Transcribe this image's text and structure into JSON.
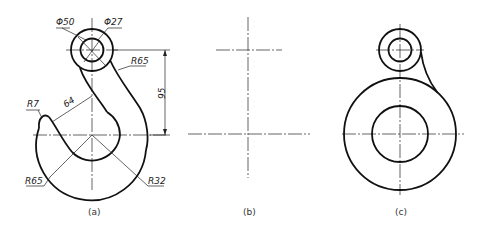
{
  "figures": [
    {
      "id": "a",
      "caption": "(a)",
      "description": "Hook drawing with dimensions",
      "dimensions": {
        "dia_outer": "Φ50",
        "dia_inner": "Φ27",
        "r_connect": "R65",
        "r_tip": "R7",
        "length": "64",
        "height": "95",
        "r_outer": "R65",
        "r_inner": "R32"
      }
    },
    {
      "id": "b",
      "caption": "(b)",
      "description": "Center lines layout"
    },
    {
      "id": "c",
      "caption": "(c)",
      "description": "Circles with tangent arc"
    }
  ],
  "colors": {
    "line": "#111111",
    "background": "#ffffff"
  }
}
